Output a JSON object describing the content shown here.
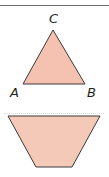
{
  "figure": {
    "triangle": {
      "vertex_labels": {
        "top": "C",
        "left": "A",
        "right": "B"
      },
      "fill": "#f5c2b2",
      "stroke": "#3a3a3a"
    },
    "trapezoid": {
      "fill": "#f5c9b8",
      "stroke": "#3a3a3a"
    }
  }
}
